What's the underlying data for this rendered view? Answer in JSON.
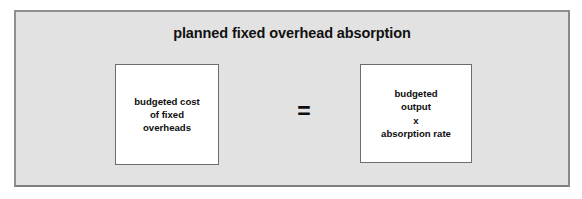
{
  "diagram": {
    "title": "planned fixed overhead absorption",
    "operator": "=",
    "operator_name": "equals-sign",
    "left_term": {
      "text": "budgeted cost\nof fixed\noverheads",
      "lines": [
        "budgeted cost",
        "of fixed",
        "overheads"
      ]
    },
    "right_term": {
      "text": "budgeted\noutput\nx\nabsorption rate",
      "lines": [
        "budgeted",
        "output",
        "x",
        "absorption rate"
      ]
    },
    "colors": {
      "panel_background": "#e2e2e2",
      "panel_border": "#8a8a8a",
      "box_background": "#ffffff",
      "box_border": "#6d6d6d",
      "text": "#0d0d0d",
      "page_background": "#ffffff"
    }
  }
}
